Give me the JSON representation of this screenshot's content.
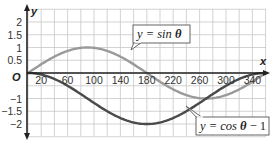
{
  "chart_data": {
    "type": "line",
    "title": "",
    "xlabel": "x",
    "ylabel": "y",
    "origin_label": "O",
    "xlim": [
      0,
      360
    ],
    "ylim": [
      -2.5,
      2.2
    ],
    "grid": true,
    "x_ticks": [
      20,
      60,
      100,
      140,
      180,
      220,
      260,
      300,
      340
    ],
    "y_ticks": [
      {
        "value": 2,
        "label": "2"
      },
      {
        "value": 1.5,
        "label": "1.5"
      },
      {
        "value": 1,
        "label": "1"
      },
      {
        "value": 0.5,
        "label": "0.5"
      },
      {
        "value": -1,
        "label": "−1"
      },
      {
        "value": -1.5,
        "label": "−1.5"
      },
      {
        "value": -2,
        "label": "−2"
      }
    ],
    "series": [
      {
        "name": "y = sin θ",
        "label_prefix": "y = sin ",
        "label_var": "θ",
        "label_suffix": "",
        "color": "#9a9a9a",
        "function": "sin",
        "x": [
          0,
          30,
          60,
          90,
          120,
          150,
          180,
          210,
          240,
          270,
          300,
          330,
          360
        ],
        "values": [
          0,
          0.5,
          0.87,
          1,
          0.87,
          0.5,
          0,
          -0.5,
          -0.87,
          -1,
          -0.87,
          -0.5,
          0
        ]
      },
      {
        "name": "y = cos θ − 1",
        "label_prefix": "y = cos ",
        "label_var": "θ",
        "label_suffix": " − 1",
        "color": "#4a4a4a",
        "function": "cos-1",
        "x": [
          0,
          30,
          60,
          90,
          120,
          150,
          180,
          210,
          240,
          270,
          300,
          330,
          360
        ],
        "values": [
          0,
          -0.13,
          -0.5,
          -1,
          -1.5,
          -1.87,
          -2,
          -1.87,
          -1.5,
          -1,
          -0.5,
          -0.13,
          0
        ]
      }
    ]
  }
}
